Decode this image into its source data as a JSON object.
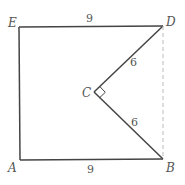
{
  "diagram": {
    "type": "geometry-figure",
    "colors": {
      "stroke": "#444444",
      "dashed": "#bbbbbb",
      "text": "#555555",
      "background": "#ffffff"
    },
    "points": {
      "E": {
        "label": "E",
        "x": 19,
        "y": 27
      },
      "D": {
        "label": "D",
        "x": 163,
        "y": 26
      },
      "C": {
        "label": "C",
        "x": 94,
        "y": 92
      },
      "A": {
        "label": "A",
        "x": 20,
        "y": 160
      },
      "B": {
        "label": "B",
        "x": 163,
        "y": 159
      }
    },
    "segments": [
      {
        "from": "E",
        "to": "D",
        "style": "solid",
        "length_label": "9"
      },
      {
        "from": "E",
        "to": "A",
        "style": "solid",
        "length_label": ""
      },
      {
        "from": "A",
        "to": "B",
        "style": "solid",
        "length_label": "9"
      },
      {
        "from": "B",
        "to": "C",
        "style": "solid",
        "length_label": "6"
      },
      {
        "from": "C",
        "to": "D",
        "style": "solid",
        "length_label": "6"
      },
      {
        "from": "D",
        "to": "B",
        "style": "dashed",
        "length_label": ""
      }
    ],
    "labels": {
      "E": "E",
      "D": "D",
      "C": "C",
      "A": "A",
      "B": "B",
      "ED_length": "9",
      "AB_length": "9",
      "CD_length": "6",
      "CB_length": "6"
    },
    "right_angle_at": "C"
  }
}
